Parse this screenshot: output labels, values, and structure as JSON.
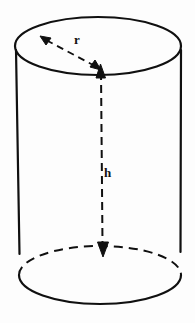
{
  "figure": {
    "name": "cylinder-diagram",
    "background_color": "#fdfdfd",
    "stroke_color": "#101010"
  },
  "labels": {
    "radius": "r",
    "height": "h"
  },
  "icons": {
    "radius_arrow": "double-headed-dashed-arrow",
    "height_arrow": "double-headed-dashed-arrow"
  },
  "geometry": {
    "top_ellipse": {
      "center_x": 98,
      "center_y": 46,
      "rx": 83,
      "ry": 29,
      "style": "solid"
    },
    "bottom_ellipse": {
      "center_x": 100,
      "center_y": 275,
      "rx": 81,
      "ry": 29,
      "front_arc_style": "solid",
      "back_arc_style": "dashed"
    },
    "left_side": {
      "x": 16,
      "y_top": 56,
      "y_bottom": 253
    },
    "right_side": {
      "x": 181,
      "y_top": 58,
      "y_bottom": 250
    },
    "radius_arrow": {
      "from_x": 98,
      "from_y": 68,
      "to_x": 42,
      "to_y": 38,
      "style": "dashed",
      "arrowheads": "both"
    },
    "height_arrow": {
      "x": 101,
      "y_top": 68,
      "y_bottom": 255,
      "style": "dashed",
      "arrowheads": "both"
    }
  }
}
